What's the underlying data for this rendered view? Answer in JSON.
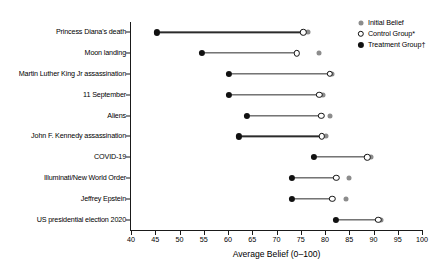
{
  "chart_data": {
    "type": "scatter",
    "title": "",
    "xlabel": "Average Belief (0–100)",
    "ylabel": "",
    "xlim": [
      40,
      100
    ],
    "xticks": [
      40,
      45,
      50,
      55,
      60,
      65,
      70,
      75,
      80,
      85,
      90,
      95,
      100
    ],
    "grid": false,
    "legend_position": "top-right",
    "categories": [
      "Princess Diana's death",
      "Moon landing",
      "Martin Luther King Jr assassination",
      "11 September",
      "Aliens",
      "John F. Kennedy assassination",
      "COVID-19",
      "Illuminati/New World Order",
      "Jeffrey Epstein",
      "US presidential election 2020"
    ],
    "series": [
      {
        "name": "Initial Belief",
        "marker": "filled-gray-circle",
        "color": "#8c8c8c",
        "values": [
          76.5,
          78.8,
          81.5,
          79.6,
          81.0,
          80.2,
          89.5,
          85.0,
          84.3,
          91.5
        ]
      },
      {
        "name": "Control Group*",
        "marker": "open-circle",
        "color": "#ffffff",
        "values": [
          75.5,
          74.2,
          81.0,
          78.8,
          79.2,
          79.4,
          88.7,
          82.3,
          81.5,
          91.0
        ]
      },
      {
        "name": "Treatment Group†",
        "marker": "filled-black-circle",
        "color": "#111111",
        "values": [
          45.4,
          54.6,
          60.2,
          60.2,
          63.9,
          62.3,
          77.7,
          73.2,
          73.2,
          82.2
        ]
      }
    ]
  },
  "legend": {
    "items": [
      {
        "label": "Initial Belief",
        "marker": "initial"
      },
      {
        "label": "Control Group*",
        "marker": "control"
      },
      {
        "label": "Treatment Group†",
        "marker": "treatment"
      }
    ]
  }
}
